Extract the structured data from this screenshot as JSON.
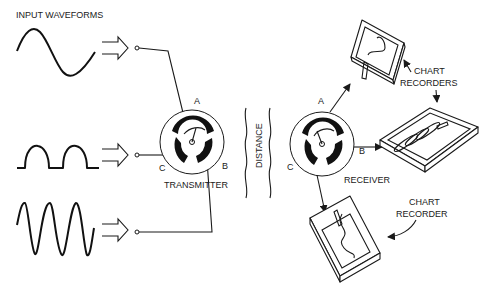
{
  "diagram": {
    "labels": {
      "input_waveforms": "INPUT WAVEFORMS",
      "transmitter": "TRANSMITTER",
      "receiver": "RECEIVER",
      "distance": "DISTANCE",
      "chart_recorders_line1": "CHART",
      "chart_recorders_line2": "RECORDERS",
      "chart_recorder_line1": "CHART",
      "chart_recorder_line2": "RECORDER"
    },
    "transmitter_terminals": {
      "a": "A",
      "b": "B",
      "c": "C"
    },
    "receiver_terminals": {
      "a": "A",
      "b": "B",
      "c": "C"
    },
    "waveforms": [
      {
        "name": "sine",
        "channel": "A"
      },
      {
        "name": "half-wave rectified",
        "channel": "C"
      },
      {
        "name": "high-frequency sine",
        "channel": "B"
      }
    ],
    "recorders": [
      {
        "name": "chart-recorder-a",
        "channel": "A",
        "trace": "curve"
      },
      {
        "name": "chart-recorder-b",
        "channel": "B",
        "trace": "loops"
      },
      {
        "name": "chart-recorder-c",
        "channel": "C",
        "trace": "wavy"
      }
    ]
  }
}
